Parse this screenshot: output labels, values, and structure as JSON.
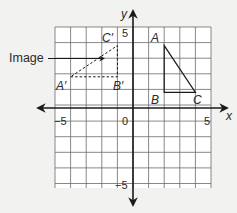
{
  "diagram": {
    "type": "coordinate-plane-transformation",
    "axes": {
      "x_label": "x",
      "y_label": "y",
      "x_range": [
        -5,
        5
      ],
      "y_range": [
        -5,
        5
      ],
      "tick_labels": {
        "x_neg": "−5",
        "x_pos": "5",
        "y_pos": "5",
        "y_neg": "−5",
        "origin": "0"
      }
    },
    "preimage": {
      "style": "solid",
      "points": [
        {
          "label": "A",
          "x": 2,
          "y": 4
        },
        {
          "label": "B",
          "x": 2,
          "y": 1
        },
        {
          "label": "C",
          "x": 4,
          "y": 1
        }
      ]
    },
    "image": {
      "style": "dashed",
      "points": [
        {
          "label": "A′",
          "x": -4,
          "y": 2
        },
        {
          "label": "B′",
          "x": -1,
          "y": 2
        },
        {
          "label": "C′",
          "x": -1,
          "y": 4
        }
      ]
    },
    "callout": {
      "label": "Image"
    },
    "colors": {
      "grid": "#555555",
      "axis": "#1a1a1a",
      "background": "#f2f2f0",
      "grid_fill": "#ffffff"
    }
  }
}
